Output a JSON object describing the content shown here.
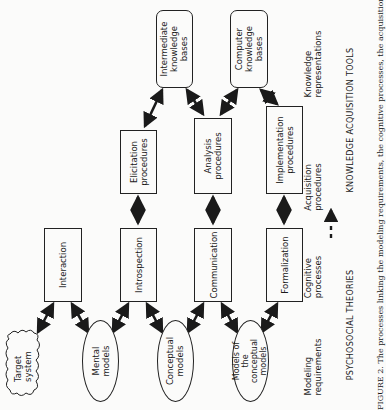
{
  "diagram": {
    "orientation": "rotated-90-ccw",
    "nodes": {
      "target_system": "Target system",
      "mental_models": "Mental models",
      "conceptual_models": "Conceptual models",
      "models_of_conceptual": "Models of the conceptual models",
      "interaction": "Interaction",
      "introspection": "Introspection",
      "communication": "Communication",
      "formalization": "Formalization",
      "elicitation": "Elicitation procedures",
      "analysis": "Analysis procedures",
      "implementation": "Implementation procedures",
      "intermediate_kb": "Intermediate knowledge bases",
      "computer_kb": "Computer knowledge bases"
    },
    "row_labels": {
      "modeling": "Modeling requirements",
      "cognitive": "Cognitive processes",
      "acquisition": "Acquisition procedures",
      "knowledge": "Knowledge representations"
    },
    "headings": {
      "left": "PSYCHOSOCIAL THEORIES",
      "right": "KNOWLEDGE ACQUISITION TOOLS"
    },
    "caption": "FIGURE 2. The processes linking the modeling requirements, the cognitive processes, the acquisition"
  }
}
